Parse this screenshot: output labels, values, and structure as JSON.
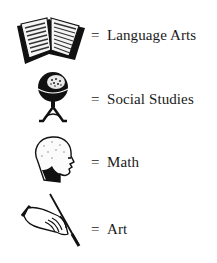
{
  "legend": {
    "items": [
      {
        "icon": "open-book-icon",
        "separator": "=",
        "label": "Language Arts"
      },
      {
        "icon": "globe-icon",
        "separator": "=",
        "label": "Social Studies"
      },
      {
        "icon": "human-head-profile-icon",
        "separator": "=",
        "label": "Math"
      },
      {
        "icon": "hand-holding-brush-icon",
        "separator": "=",
        "label": "Art"
      }
    ]
  }
}
